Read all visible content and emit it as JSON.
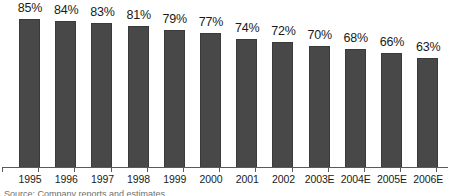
{
  "chart_data": {
    "type": "bar",
    "title": "",
    "subtitle": "",
    "xlabel": "",
    "ylabel": "",
    "orientation": "vertical",
    "grid": false,
    "legend": null,
    "axis": {
      "x_axis_visible": true,
      "y_axis_visible": false,
      "ticks_between_categories": true
    },
    "ylim": [
      0,
      100
    ],
    "value_suffix": "%",
    "series_color": "#484848",
    "categories": [
      "1995",
      "1996",
      "1997",
      "1998",
      "1999",
      "2000",
      "2001",
      "2002",
      "2003E",
      "2004E",
      "2005E",
      "2006E"
    ],
    "values": [
      85,
      84,
      83,
      81,
      79,
      77,
      74,
      72,
      70,
      68,
      66,
      63
    ],
    "data_labels": [
      "85%",
      "84%",
      "83%",
      "81%",
      "79%",
      "77%",
      "74%",
      "72%",
      "70%",
      "68%",
      "66%",
      "63%"
    ]
  },
  "caption": {
    "text": "Source: Company reports and estimates",
    "clipped": true
  }
}
